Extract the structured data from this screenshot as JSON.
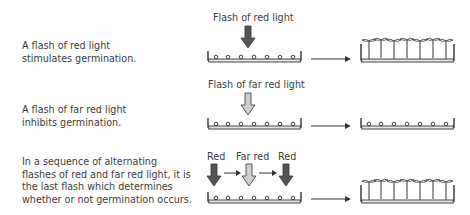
{
  "rows": [
    {
      "description": "A flash of red light\nstimulates germination.",
      "flash_label": "Flash of red light",
      "flashes": [
        {
          "type": "red",
          "color": "#555555"
        }
      ],
      "outcome": "germinated"
    },
    {
      "description": "A flash of far red light\ninhibits germination.",
      "flash_label": "Flash of far red light",
      "flashes": [
        {
          "type": "far-red",
          "color": "#cccccc"
        }
      ],
      "outcome": "not-germinated"
    },
    {
      "description": "In a sequence of alternating\nflashes of red and far red light, it is\nthe last flash which determines\nwhether or not germination occurs.",
      "flash_labels": [
        "Red",
        "Far red",
        "Red"
      ],
      "flashes": [
        {
          "type": "red",
          "color": "#555555"
        },
        {
          "type": "far-red",
          "color": "#cccccc"
        },
        {
          "type": "red",
          "color": "#555555"
        }
      ],
      "outcome": "germinated"
    }
  ],
  "colors": {
    "red_flash": "#555555",
    "far_red_flash": "#cccccc",
    "line": "#333333",
    "dish_fill": "#e6e6e6"
  }
}
